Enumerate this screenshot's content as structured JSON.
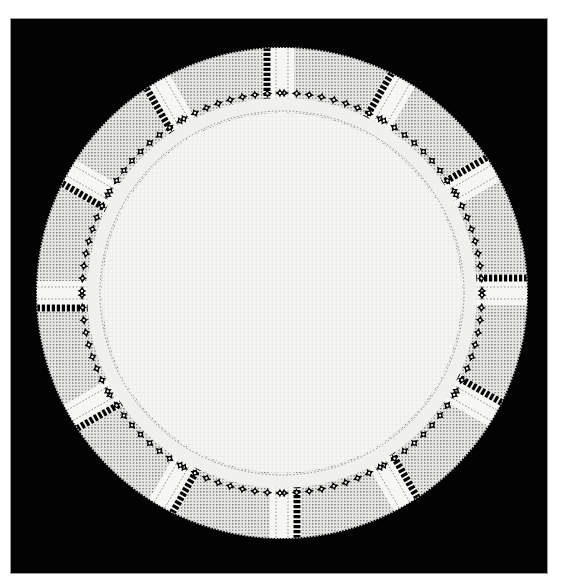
{
  "image": {
    "description": "Round white linen doily with drawn-thread hardanger-style lace border on black background",
    "background_color": "#030303",
    "page_color": "#ffffff",
    "linen_color": "#f4f4f2",
    "lace_color": "#e6e6e4",
    "hole_color": "#050505"
  },
  "doily": {
    "center": [
      282,
      293
    ],
    "outer_radius": 245,
    "inner_radius": 180,
    "spokes": 12,
    "motif_panels": 12
  }
}
